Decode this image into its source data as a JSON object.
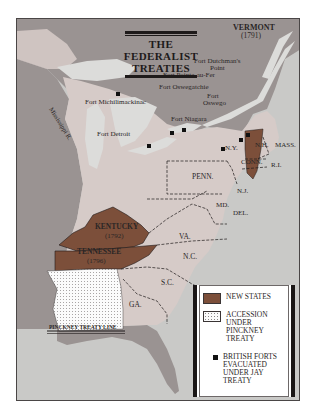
{
  "title": {
    "line1": "THE",
    "line2": "FEDERALIST",
    "line3": "TREATIES"
  },
  "colors": {
    "ocean": "#c9c9c7",
    "foreign_land": "#9a9392",
    "us_land": "#d6cbc8",
    "new_states": "#7c4f3a",
    "pinckney_cession": "#fbfbfb",
    "lakes": "#dcdcda",
    "border": "#1e1a1a"
  },
  "states": {
    "vermont": {
      "name": "VERMONT",
      "year": "(1791)"
    },
    "kentucky": {
      "name": "KENTUCKY",
      "year": "(1792)"
    },
    "tennessee": {
      "name": "TENNESSEE",
      "year": "(1796)"
    },
    "nh": "N.H.",
    "mass": "MASS.",
    "ny": "N.Y.",
    "conn": "CONN.",
    "ri": "R.I.",
    "penn": "PENN.",
    "nj": "N.J.",
    "md": "MD.",
    "del": "DEL.",
    "va": "VA.",
    "nc": "N.C.",
    "sc": "S.C.",
    "ga": "GA."
  },
  "forts": [
    {
      "name": "Fort Dutchman's",
      "name2": "Point"
    },
    {
      "name": "Fort Pointe-au-Fer"
    },
    {
      "name": "Fort Oswegatchie"
    },
    {
      "name": "Fort",
      "name2": "Oswego"
    },
    {
      "name": "Fort Niagara"
    },
    {
      "name": "Fort Michilimackinac"
    },
    {
      "name": "Fort Detroit"
    }
  ],
  "features": {
    "river": "Mississippi R.",
    "pinckney_line": "PINCKNEY TREATY LINE"
  },
  "legend": {
    "items": [
      {
        "label": "NEW STATES"
      },
      {
        "label1": "ACCESSION",
        "label2": "UNDER",
        "label3": "PINCKNEY",
        "label4": "TREATY"
      },
      {
        "label1": "BRITISH FORTS",
        "label2": "EVACUATED",
        "label3": "UNDER JAY",
        "label4": "TREATY"
      }
    ]
  }
}
